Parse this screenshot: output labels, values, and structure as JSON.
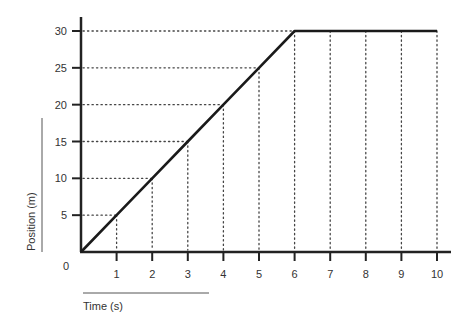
{
  "chart_data": {
    "type": "line",
    "title": "",
    "xlabel": "Time (s)",
    "ylabel": "Position (m)",
    "origin_label": "0",
    "x_ticks": [
      1,
      2,
      3,
      4,
      5,
      6,
      7,
      8,
      9,
      10
    ],
    "y_ticks": [
      5,
      10,
      15,
      20,
      25,
      30
    ],
    "xlim": [
      0,
      10
    ],
    "ylim": [
      0,
      30
    ],
    "grid": "dotted guide lines",
    "series": [
      {
        "name": "Position",
        "x": [
          0,
          1,
          2,
          3,
          4,
          5,
          6,
          7,
          8,
          9,
          10
        ],
        "y": [
          0,
          5,
          10,
          15,
          20,
          25,
          30,
          30,
          30,
          30,
          30
        ]
      }
    ]
  }
}
